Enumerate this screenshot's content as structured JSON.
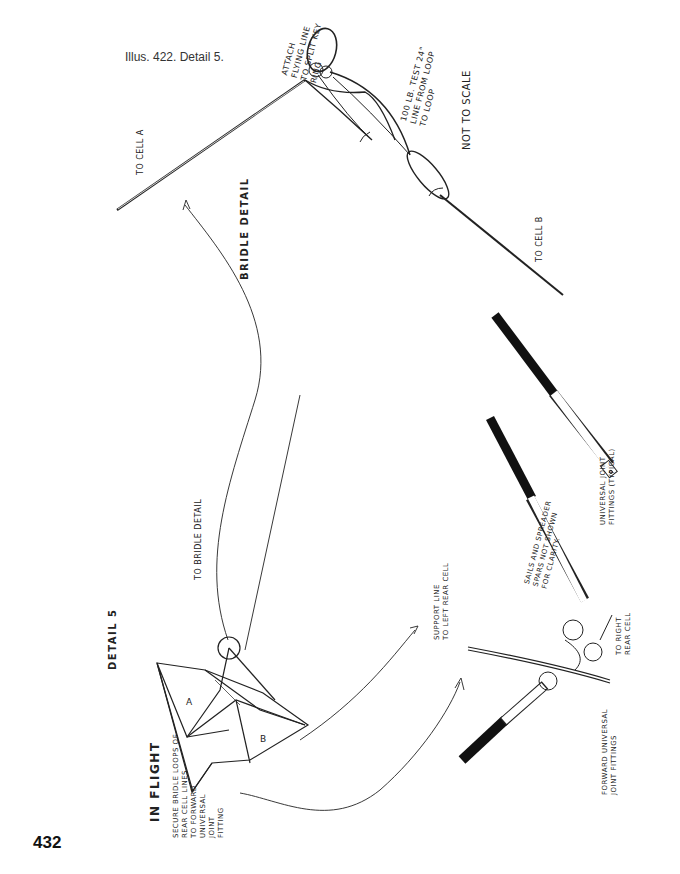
{
  "page": {
    "caption": "Illus. 422. Detail 5.",
    "page_number": "432"
  },
  "bridle_detail": {
    "title": "BRIDLE DETAIL",
    "not_to_scale": "NOT TO SCALE",
    "attach_note": "ATTACH\nFLYING LINE\nTO SPLIT KEY\nRING",
    "line_note": "100 LB. TEST 24\"\nLINE FROM LOOP\nTO LOOP",
    "to_cell_a": "TO CELL A",
    "to_cell_b": "TO CELL B"
  },
  "in_flight": {
    "title": "IN FLIGHT",
    "detail_label": "DETAIL 5",
    "to_bridle_detail": "TO BRIDLE DETAIL",
    "secure_note": "SECURE BRIDLE LOOPS OF\nREAR CELL LINES\nTO FORWARD\nUNIVERSAL\nJOINT\nFITTING",
    "cell_a": "A",
    "cell_b": "B"
  },
  "joint_detail": {
    "support_line": "SUPPORT LINE\nTO LEFT REAR CELL",
    "sails_note": "SAILS AND SPREADER\nSPARS NOT SHOWN\nFOR CLARITY.",
    "universal_joint": "UNIVERSAL JOINT\nFITTINGS (TYPICAL)",
    "to_right_rear": "TO RIGHT\nREAR CELL",
    "forward_universal": "FORWARD UNIVERSAL\nJOINT FITTINGS"
  }
}
